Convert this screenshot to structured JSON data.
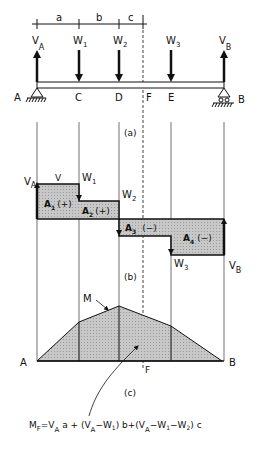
{
  "diagram": {
    "dimensions": {
      "a": "a",
      "b": "b",
      "c": "c"
    },
    "beam": {
      "points": [
        {
          "name": "A",
          "label": "A"
        },
        {
          "name": "C",
          "label": "C"
        },
        {
          "name": "D",
          "label": "D"
        },
        {
          "name": "F",
          "label": "F"
        },
        {
          "name": "E",
          "label": "E"
        },
        {
          "name": "B",
          "label": "B"
        }
      ],
      "reactions": [
        {
          "name": "VA",
          "label": "V",
          "sub": "A"
        },
        {
          "name": "VB",
          "label": "V",
          "sub": "B"
        }
      ],
      "loads": [
        {
          "name": "W1",
          "label": "W",
          "sub": "1"
        },
        {
          "name": "W2",
          "label": "W",
          "sub": "2"
        },
        {
          "name": "W3",
          "label": "W",
          "sub": "3"
        }
      ],
      "caption": "(a)"
    },
    "shear": {
      "label_v": "V",
      "va": {
        "label": "V",
        "sub": "A"
      },
      "vb": {
        "label": "V",
        "sub": "B"
      },
      "w1": {
        "label": "W",
        "sub": "1"
      },
      "w2": {
        "label": "W",
        "sub": "2"
      },
      "w3": {
        "label": "W",
        "sub": "3"
      },
      "areas": [
        {
          "label": "A",
          "sub": "1",
          "sign": "(+)"
        },
        {
          "label": "A",
          "sub": "2",
          "sign": "(+)"
        },
        {
          "label": "A",
          "sub": "3",
          "sign": "(−)"
        },
        {
          "label": "A",
          "sub": "4",
          "sign": "(−)"
        }
      ],
      "caption": "(b)"
    },
    "moment": {
      "label_m": "M",
      "left": "A",
      "right": "B",
      "section": "F",
      "caption": "(c)"
    },
    "formula": {
      "lhs": "M",
      "lhs_sub": "F",
      "text": "= V_A a + (V_A − W_1) b + (V_A − W_1 − W_2) c"
    }
  }
}
